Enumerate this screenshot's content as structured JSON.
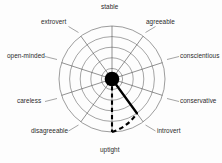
{
  "chart_data": {
    "type": "radar",
    "title": "",
    "subtitle": "",
    "xlabel": "",
    "ylabel": "",
    "grid": true,
    "legend_position": "none",
    "rings": 5,
    "radial_range": [
      0,
      5
    ],
    "categories": [
      "stable",
      "agreeable",
      "conscientious",
      "conservative",
      "introvert",
      "uptight",
      "disagreeable",
      "careless",
      "open-minded",
      "extrovert"
    ],
    "category_angles_deg": [
      90,
      54,
      18,
      342,
      306,
      270,
      234,
      198,
      162,
      126
    ],
    "series": [
      {
        "name": "introvert-axis-trace",
        "style": "solid",
        "axis": "introvert",
        "value": 4.0
      },
      {
        "name": "uptight-axis-trace",
        "style": "dashed",
        "axis": "uptight",
        "value": 5.0
      },
      {
        "name": "connecting-arc",
        "style": "dashed",
        "from_axis": "uptight",
        "to_axis": "introvert",
        "from_value": 5.0,
        "to_value": 4.0
      }
    ],
    "values": [
      0,
      0,
      0,
      0,
      4.0,
      5.0,
      0,
      0,
      0,
      0
    ],
    "center_marker": {
      "name": "center-hub",
      "shape": "filled-circle",
      "value": 0
    }
  },
  "labels": {
    "stable": "stable",
    "agreeable": "agreeable",
    "conscientious": "conscientious",
    "conservative": "conservative",
    "introvert": "introvert",
    "uptight": "uptight",
    "disagreeable": "disagreeable",
    "careless": "careless",
    "open_minded": "open-minded",
    "extrovert": "extrovert"
  },
  "colors": {
    "background": "#fdfdfd",
    "grid": "#5a5a5a",
    "spoke": "#4a4a4a",
    "trace": "#000000",
    "hub": "#000000",
    "label_text": "#2b2b2b",
    "leader": "#4a4a4a"
  }
}
